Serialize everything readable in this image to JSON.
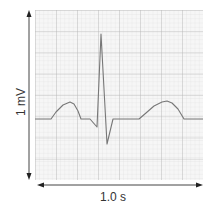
{
  "diagram": {
    "y_label": "1 mV",
    "x_label": "1.0 s",
    "colors": {
      "grid_fine": "#e4e4e4",
      "grid_major": "#b8b8b8",
      "trace": "#777777",
      "axis": "#333333",
      "background": "#f6f6f6"
    },
    "waveform_components": [
      "P wave",
      "Q",
      "R peak",
      "S",
      "T wave"
    ]
  }
}
